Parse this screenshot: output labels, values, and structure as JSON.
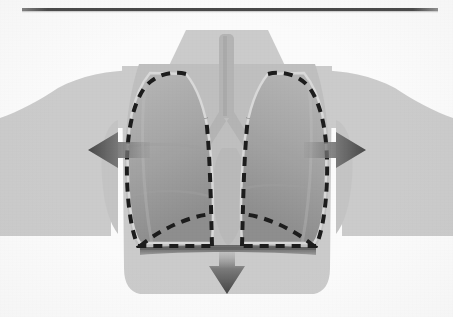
{
  "figure": {
    "subject": "Lungs expanding inside rib cage with diaphragm contracting downward",
    "style": "grayscale halftone textbook illustration on off-white paper",
    "canvas": {
      "width": 453,
      "height": 317
    },
    "background_color": "#fbfbfb"
  },
  "rule": {
    "name": "top horizontal rule",
    "color": "#4a4a4a",
    "x1": 22,
    "x2": 438,
    "y": 9,
    "thickness": 3
  },
  "body_silhouette": {
    "label": "torso and shoulders silhouette",
    "fill_color": "#c9c9c9",
    "edge_color": "#bdbdbd",
    "neck_top_y": 30,
    "shoulder_y": 72,
    "bottom_y": 295
  },
  "thoracic_cavity": {
    "label": "thoracic cavity / rib cage interior",
    "fill_color": "#bcbcbc"
  },
  "lungs": [
    {
      "name": "right lung (viewer left)",
      "fill_top_color": "#a8a8a8",
      "fill_bottom_color": "#8f8f8f",
      "outline_color": "#d5d5d5",
      "lobes": 3
    },
    {
      "name": "left lung (viewer right)",
      "fill_top_color": "#a8a8a8",
      "fill_bottom_color": "#8f8f8f",
      "outline_color": "#d5d5d5",
      "lobes": 2
    }
  ],
  "airway": {
    "label": "trachea and primary bronchi",
    "fill_color": "#b0b0b0",
    "trachea_top_y": 34,
    "carina_y": 118
  },
  "dashed_outline": {
    "label": "expanded lung boundary at full inhalation",
    "color": "#111111",
    "stroke_width": 4,
    "dash_pattern": "9 7",
    "meaning": "dashed line marks the lung volume after inspiration"
  },
  "diaphragm": {
    "label": "flattened diaphragm",
    "color": "#6f6f6f",
    "y": 247,
    "thickness": 8,
    "state": "contracted and flattened"
  },
  "arrows": [
    {
      "name": "chest-expansion-arrow-left",
      "direction": "left",
      "meaning": "rib cage expands outward",
      "color": "#555555",
      "tip_x": 88,
      "tail_x": 148,
      "y": 150
    },
    {
      "name": "chest-expansion-arrow-right",
      "direction": "right",
      "meaning": "rib cage expands outward",
      "color": "#555555",
      "tip_x": 366,
      "tail_x": 306,
      "y": 150
    },
    {
      "name": "hilum-arrow-left",
      "direction": "right",
      "meaning": "air drawn in toward hilum",
      "color": "#9d9d9d",
      "y": 137
    },
    {
      "name": "hilum-arrow-right",
      "direction": "left",
      "meaning": "air drawn in toward hilum",
      "color": "#9d9d9d",
      "y": 137
    },
    {
      "name": "diaphragm-descent-arrow",
      "direction": "down",
      "meaning": "diaphragm moves downward",
      "color": "#4f4f4f",
      "x": 227,
      "tail_y": 252,
      "tip_y": 294
    }
  ]
}
